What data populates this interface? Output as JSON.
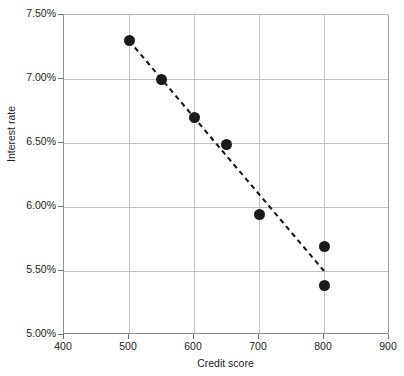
{
  "chart_data": {
    "type": "scatter",
    "title": "",
    "xlabel": "Credit score",
    "ylabel": "Interest rate",
    "xlim": [
      400,
      900
    ],
    "ylim": [
      5.0,
      7.5
    ],
    "grid": true,
    "legend": "none",
    "x_ticks": [
      "400",
      "500",
      "600",
      "700",
      "800",
      "900"
    ],
    "x_tick_values": [
      400,
      500,
      600,
      700,
      800,
      900
    ],
    "y_ticks": [
      "5.00%",
      "5.50%",
      "6.00%",
      "6.50%",
      "7.00%",
      "7.50%"
    ],
    "y_tick_values": [
      5.0,
      5.5,
      6.0,
      6.5,
      7.0,
      7.5
    ],
    "series": [
      {
        "name": "Observations",
        "marker": "filled-circle",
        "color": "#1a1a1a",
        "points": [
          {
            "x": 500,
            "y": 7.3
          },
          {
            "x": 550,
            "y": 7.0
          },
          {
            "x": 600,
            "y": 6.7
          },
          {
            "x": 650,
            "y": 6.49
          },
          {
            "x": 700,
            "y": 5.94
          },
          {
            "x": 800,
            "y": 5.69
          },
          {
            "x": 800,
            "y": 5.39
          }
        ]
      }
    ],
    "trendline": {
      "name": "Linear trend",
      "style": "dashed",
      "color": "#1a1a1a",
      "start": {
        "x": 500,
        "y": 7.3
      },
      "end": {
        "x": 800,
        "y": 5.5
      }
    }
  },
  "colors": {
    "marker": "#1a1a1a",
    "trendline": "#1a1a1a",
    "gridline": "#c2c2c2",
    "axis": "#8d8d8d",
    "text": "#1c1c1c",
    "background": "#ffffff"
  }
}
